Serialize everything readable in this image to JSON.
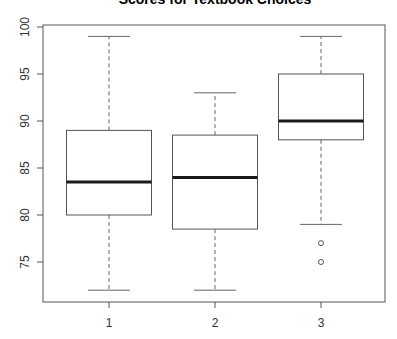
{
  "chart_data": {
    "type": "boxplot",
    "title": "Scores for Textbook Choices",
    "xlabel": "",
    "ylabel": "",
    "categories": [
      "1",
      "2",
      "3"
    ],
    "ylim": [
      71,
      100
    ],
    "yticks": [
      75,
      80,
      85,
      90,
      95,
      100
    ],
    "grid": false,
    "legend": null,
    "boxes": [
      {
        "label": "1",
        "whisker_low": 72,
        "q1": 80,
        "median": 83.5,
        "q3": 89,
        "whisker_high": 99,
        "outliers": []
      },
      {
        "label": "2",
        "whisker_low": 72,
        "q1": 78.5,
        "median": 84,
        "q3": 88.5,
        "whisker_high": 93,
        "outliers": []
      },
      {
        "label": "3",
        "whisker_low": 79,
        "q1": 88,
        "median": 90,
        "q3": 95,
        "whisker_high": 99,
        "outliers": [
          77,
          75
        ]
      }
    ]
  },
  "colors": {
    "box_border": "#555555",
    "median": "#1a1a1a",
    "whisker": "#666666",
    "axis": "#555555",
    "text": "#333333"
  }
}
